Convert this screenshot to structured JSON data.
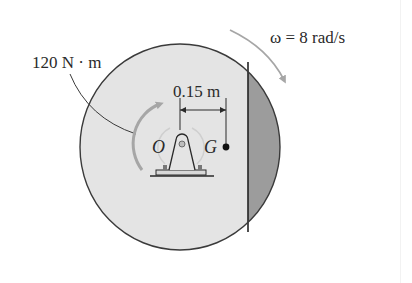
{
  "figure": {
    "moment_label": "120 N · m",
    "omega_label": "ω = 8 rad/s",
    "distance_label": "0.15 m",
    "pin_label": "O",
    "center_of_mass_label": "G"
  },
  "colors": {
    "disk_fill": "#e4e4e4",
    "disk_flat_fill": "#9c9c9c",
    "disk_outline": "#3a3a3a",
    "arrow_gray": "#a6a6a6",
    "text": "#2a2a2a"
  }
}
